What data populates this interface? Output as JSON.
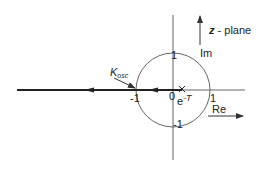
{
  "diagram": {
    "title": "z - plane",
    "title_var": "z",
    "title_rest": " - plane",
    "axes": {
      "real_label": "Re",
      "imag_label": "Im"
    },
    "ticks": {
      "real_pos": "1",
      "real_neg": "-1",
      "imag_pos": "1",
      "imag_neg": "-1",
      "origin": "0"
    },
    "annotations": {
      "k_osc_main": "K",
      "k_osc_sub": "osc",
      "pole_label": "e",
      "pole_exp": "-T",
      "pole_marker": "×"
    },
    "colors": {
      "line": "#333333",
      "background": "#ffffff"
    }
  }
}
